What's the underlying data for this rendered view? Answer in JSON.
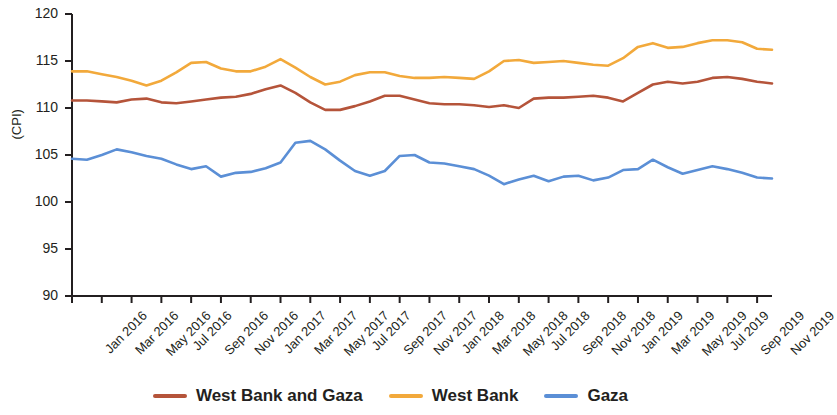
{
  "chart_data": {
    "type": "line",
    "title": "",
    "xlabel": "",
    "ylabel": "(CPI)",
    "ylim": [
      90,
      120
    ],
    "yticks": [
      90,
      95,
      100,
      105,
      110,
      115,
      120
    ],
    "grid": false,
    "legend_position": "bottom",
    "x": [
      "Jan 2016",
      "Feb 2016",
      "Mar 2016",
      "Apr 2016",
      "May 2016",
      "Jun 2016",
      "Jul 2016",
      "Aug 2016",
      "Sep 2016",
      "Oct 2016",
      "Nov 2016",
      "Dec 2016",
      "Jan 2017",
      "Feb 2017",
      "Mar 2017",
      "Apr 2017",
      "May 2017",
      "Jun 2017",
      "Jul 2017",
      "Aug 2017",
      "Sep 2017",
      "Oct 2017",
      "Nov 2017",
      "Dec 2017",
      "Jan 2018",
      "Feb 2018",
      "Mar 2018",
      "Apr 2018",
      "May 2018",
      "Jun 2018",
      "Jul 2018",
      "Aug 2018",
      "Sep 2018",
      "Oct 2018",
      "Nov 2018",
      "Dec 2018",
      "Jan 2019",
      "Feb 2019",
      "Mar 2019",
      "Apr 2019",
      "May 2019",
      "Jun 2019",
      "Jul 2019",
      "Aug 2019",
      "Sep 2019",
      "Oct 2019",
      "Nov 2019",
      "Dec 2019"
    ],
    "xtick_labels": [
      "Jan 2016",
      "Mar 2016",
      "May 2016",
      "Jul 2016",
      "Sep 2016",
      "Nov 2016",
      "Jan 2017",
      "Mar 2017",
      "May 2017",
      "Jul 2017",
      "Sep 2017",
      "Nov 2017",
      "Jan 2018",
      "Mar 2018",
      "May 2018",
      "Jul 2018",
      "Sep 2018",
      "Nov 2018",
      "Jan 2019",
      "Mar 2019",
      "May 2019",
      "Jul 2019",
      "Sep 2019",
      "Nov 2019"
    ],
    "series": [
      {
        "name": "West Bank and Gaza",
        "color": "#b5543a",
        "values": [
          110.8,
          110.8,
          110.7,
          110.6,
          110.9,
          111.0,
          110.6,
          110.5,
          110.7,
          110.9,
          111.1,
          111.2,
          111.5,
          112.0,
          112.4,
          111.6,
          110.6,
          109.8,
          109.8,
          110.2,
          110.7,
          111.3,
          111.3,
          110.9,
          110.5,
          110.4,
          110.4,
          110.3,
          110.1,
          110.3,
          110.0,
          111.0,
          111.1,
          111.1,
          111.2,
          111.3,
          111.1,
          110.7,
          111.6,
          112.5,
          112.8,
          112.6,
          112.8,
          113.2,
          113.3,
          113.1,
          112.8,
          112.6
        ]
      },
      {
        "name": "West Bank",
        "color": "#f2a93b",
        "values": [
          113.9,
          113.9,
          113.6,
          113.3,
          112.9,
          112.4,
          112.9,
          113.8,
          114.8,
          114.9,
          114.2,
          113.9,
          113.9,
          114.4,
          115.2,
          114.3,
          113.3,
          112.5,
          112.8,
          113.5,
          113.8,
          113.8,
          113.4,
          113.2,
          113.2,
          113.3,
          113.2,
          113.1,
          113.9,
          115.0,
          115.1,
          114.8,
          114.9,
          115.0,
          114.8,
          114.6,
          114.5,
          115.3,
          116.5,
          116.9,
          116.4,
          116.5,
          116.9,
          117.2,
          117.2,
          117.0,
          116.3,
          116.2
        ]
      },
      {
        "name": "Gaza",
        "color": "#5b8fd6",
        "values": [
          104.6,
          104.5,
          105.0,
          105.6,
          105.3,
          104.9,
          104.6,
          104.0,
          103.5,
          103.8,
          102.7,
          103.1,
          103.2,
          103.6,
          104.2,
          106.3,
          106.5,
          105.6,
          104.4,
          103.3,
          102.8,
          103.3,
          104.9,
          105.0,
          104.2,
          104.1,
          103.8,
          103.5,
          102.8,
          101.9,
          102.4,
          102.8,
          102.2,
          102.7,
          102.8,
          102.3,
          102.6,
          103.4,
          103.5,
          104.5,
          103.7,
          103.0,
          103.4,
          103.8,
          103.5,
          103.1,
          102.6,
          102.5
        ]
      }
    ]
  },
  "legend": {
    "items": [
      {
        "label": "West Bank and Gaza",
        "color": "#b5543a"
      },
      {
        "label": "West Bank",
        "color": "#f2a93b"
      },
      {
        "label": "Gaza",
        "color": "#5b8fd6"
      }
    ]
  },
  "axis": {
    "y_label": "(CPI)"
  }
}
